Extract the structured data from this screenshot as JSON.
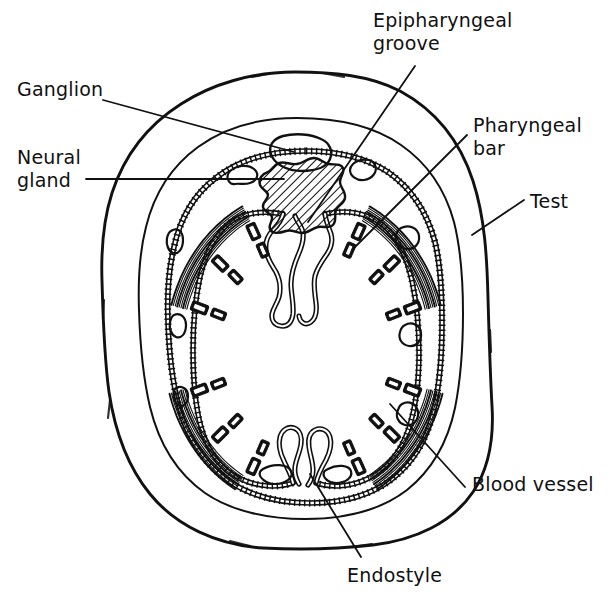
{
  "figure": {
    "kind": "biological-line-diagram",
    "background_color": "#ffffff",
    "ink_color": "#111111",
    "width_px": 611,
    "height_px": 604
  },
  "labels": {
    "ganglion": "Ganglion",
    "neural_gland_line1": "Neural",
    "neural_gland_line2": "gland",
    "epipharyngeal_line1": "Epipharyngeal",
    "epipharyngeal_line2": "groove",
    "pharyngeal_bar_line1": "Pharyngeal",
    "pharyngeal_bar_line2": "bar",
    "test": "Test",
    "blood_vessel": "Blood vessel",
    "endostyle": "Endostyle"
  },
  "structures": [
    {
      "name": "test",
      "label": "Test",
      "description": "Outermost tunic layer drawn as a single irregular hand-drawn closed curve",
      "render": "outer-outline"
    },
    {
      "name": "mantle-body-wall",
      "label": "",
      "description": "Second closed curve inside the test, plain line",
      "render": "mantle-outline"
    },
    {
      "name": "pharynx-wall-outer",
      "label": "",
      "description": "Beaded ladder-patterned epithelial wall of the atrium",
      "render": "beaded-outline"
    },
    {
      "name": "pharynx-wall-inner",
      "label": "",
      "description": "Inner beaded ladder-patterned pharyngeal epithelium with stigmata openings",
      "render": "beaded-outline"
    },
    {
      "name": "ganglion",
      "label": "Ganglion",
      "description": "Pale rounded body in the dorsal mid-line, outlined only",
      "render": "open-oval"
    },
    {
      "name": "neural-gland",
      "label": "Neural gland",
      "description": "Irregular diagonally hatched mass directly beneath the ganglion",
      "render": "hatched-blob"
    },
    {
      "name": "epipharyngeal-groove",
      "label": "Epipharyngeal groove",
      "description": "Dorsal mid-line infolding of the pharynx epithelium, convoluted beaded loops",
      "render": "convoluted-fold"
    },
    {
      "name": "endostyle",
      "label": "Endostyle",
      "description": "Ventral mid-line glandular groove, convoluted beaded loops mirroring the epipharyngeal groove",
      "render": "convoluted-fold"
    },
    {
      "name": "pharyngeal-bars",
      "label": "Pharyngeal bar",
      "description": "Series of short beaded bars and T-shaped transverse bars between the stigmata rows",
      "render": "beaded-bars"
    },
    {
      "name": "blood-vessels",
      "label": "Blood vessel",
      "description": "Small irregular open lumina scattered in the mantle and at the pharynx margin",
      "render": "open-lumen"
    },
    {
      "name": "muscle-bands",
      "label": "",
      "description": "Striated arcuate muscle bundles lying against the inner face of the mantle",
      "render": "striated-arc"
    }
  ],
  "leaders": [
    {
      "name": "ganglion",
      "from": "label",
      "to": "ganglion body"
    },
    {
      "name": "neural-gland",
      "from": "label",
      "to": "hatched gland mass"
    },
    {
      "name": "epipharyngeal-groove",
      "from": "label",
      "to": "dorsal mid-line fold"
    },
    {
      "name": "pharyngeal-bar",
      "from": "label",
      "to": "beaded transverse bar"
    },
    {
      "name": "test",
      "from": "label",
      "to": "outer tunic"
    },
    {
      "name": "blood-vessel",
      "from": "label",
      "to": "lumen near pharynx"
    },
    {
      "name": "endostyle",
      "from": "label",
      "to": "ventral mid-line groove"
    }
  ]
}
